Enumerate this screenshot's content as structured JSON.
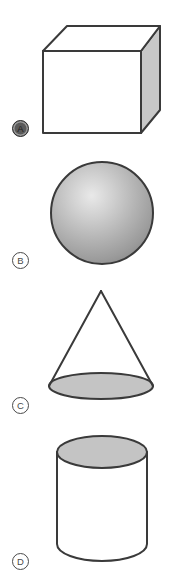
{
  "page": {
    "background_color": "#ffffff",
    "width": 172,
    "height": 584
  },
  "palette": {
    "outline": "#3a3a3a",
    "shaded_face": "#c8c8c8",
    "ellipse_fill": "#c4c4c4",
    "sphere_highlight": "#e8e8e8",
    "sphere_mid": "#b0b0b0",
    "sphere_edge": "#8a8a8a",
    "marker_text": "#4a4a4a",
    "marker_selected_fill": "#5a5a5a",
    "white": "#ffffff"
  },
  "options": [
    {
      "label": "A",
      "shape_name": "cube",
      "selected": true,
      "marker": {
        "x": 12,
        "y": 120
      },
      "shape_box": {
        "x": 38,
        "y": 18,
        "width": 124,
        "height": 120
      },
      "description": "Cube drawn in oblique projection with white front and top faces and a gray right side face"
    },
    {
      "label": "B",
      "shape_name": "sphere",
      "selected": false,
      "marker": {
        "x": 12,
        "y": 252
      },
      "shape_box": {
        "x": 48,
        "y": 160,
        "width": 106,
        "height": 106
      },
      "description": "Shaded sphere with a radial highlight toward the upper left"
    },
    {
      "label": "C",
      "shape_name": "cone",
      "selected": false,
      "marker": {
        "x": 12,
        "y": 397
      },
      "shape_box": {
        "x": 44,
        "y": 288,
        "width": 116,
        "height": 112
      },
      "description": "Cone with white lateral surface and a gray elliptical base"
    },
    {
      "label": "D",
      "shape_name": "cylinder",
      "selected": false,
      "marker": {
        "x": 12,
        "y": 553
      },
      "shape_box": {
        "x": 52,
        "y": 433,
        "width": 100,
        "height": 143
      },
      "description": "Cylinder with a gray elliptical top face and white curved body"
    }
  ]
}
